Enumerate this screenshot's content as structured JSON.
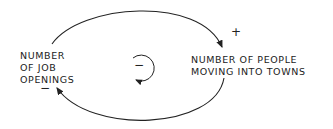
{
  "diagram": {
    "type": "causal-loop",
    "nodes": [
      {
        "id": "job_openings",
        "lines": [
          "NUMBER",
          "OF JOB",
          "OPENINGS"
        ]
      },
      {
        "id": "people_moving",
        "lines": [
          "NUMBER OF PEOPLE",
          "MOVING INTO TOWNS"
        ]
      }
    ],
    "links": [
      {
        "from": "job_openings",
        "to": "people_moving",
        "polarity": "+"
      },
      {
        "from": "people_moving",
        "to": "job_openings",
        "polarity": "−"
      }
    ],
    "loop": {
      "polarity": "−",
      "direction": "counterclockwise"
    }
  }
}
